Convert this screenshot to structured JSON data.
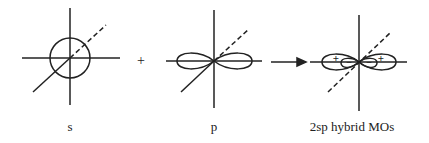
{
  "diagram": {
    "colors": {
      "ink": "#222222",
      "background": "#ffffff"
    },
    "operators": {
      "plus": "+",
      "arrow": "→"
    },
    "panels": [
      {
        "id": "s",
        "label": "s",
        "shape": "circle"
      },
      {
        "id": "p",
        "label": "p",
        "shape": "two-lobes",
        "left_sign": "+",
        "right_sign": "−"
      },
      {
        "id": "hybrid",
        "label": "2sp hybrid MOs",
        "shape": "hybrid-lobes",
        "large_lobe_sign": "+",
        "small_lobe_sign": "−"
      }
    ]
  }
}
